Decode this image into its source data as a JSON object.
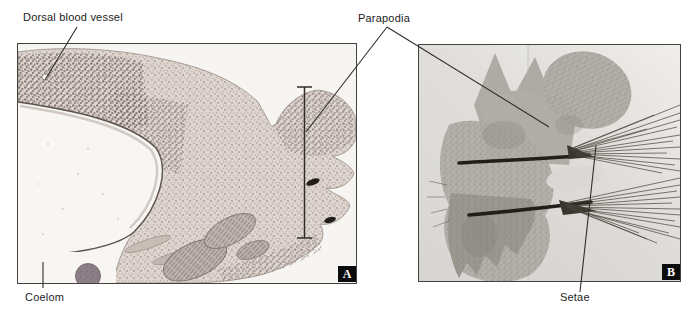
{
  "figure": {
    "labels": {
      "dorsal_blood_vessel": "Dorsal blood vessel",
      "parapodia": "Parapodia",
      "coelom": "Coelom",
      "setae": "Setae"
    },
    "panels": [
      {
        "letter": "A"
      },
      {
        "letter": "B"
      }
    ],
    "colors": {
      "background": "#ffffff",
      "panel_border": "#45413e",
      "badge_background": "#0b0b0b",
      "badge_text": "#ffffff",
      "leader_line": "#2f2d2b",
      "micrograph_a_tissue": "#ddd5ce",
      "micrograph_a_speckle": "#8b7d7a",
      "micrograph_b_tissue": "#b2afa9",
      "micrograph_b_background": "#dbd9d5",
      "acicula": "#221f1b"
    }
  }
}
